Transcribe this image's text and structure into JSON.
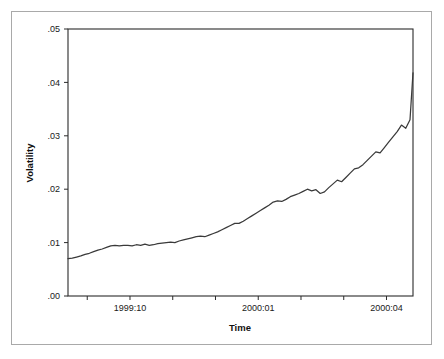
{
  "figure": {
    "background_color": "#ffffff",
    "frame_color": "#a9a9a9",
    "line_color": "#3a3a3a"
  },
  "chart_data": {
    "type": "line",
    "title": "",
    "xlabel": "Time",
    "ylabel": "Volatility",
    "grid": false,
    "legend": "none",
    "xtick_labels": [
      "1999:10",
      "2000:01",
      "2000:04"
    ],
    "xtick_positions": [
      1.0,
      4.0,
      7.0
    ],
    "minor_xticks": [
      0.0,
      2.0,
      3.0,
      5.0,
      6.0,
      8.0
    ],
    "ytick_labels": [
      ".00",
      ".01",
      ".02",
      ".03",
      ".04",
      ".05"
    ],
    "ytick_values": [
      0.0,
      0.01,
      0.02,
      0.03,
      0.04,
      0.05
    ],
    "ylim": [
      0.0,
      0.05
    ],
    "xlim": [
      -0.45,
      7.62
    ],
    "series": [
      {
        "name": "Volatility",
        "x": [
          -0.45,
          -0.35,
          -0.25,
          -0.15,
          -0.05,
          0.05,
          0.15,
          0.25,
          0.35,
          0.45,
          0.55,
          0.65,
          0.75,
          0.85,
          0.95,
          1.05,
          1.15,
          1.25,
          1.35,
          1.45,
          1.55,
          1.65,
          1.75,
          1.85,
          1.95,
          2.05,
          2.15,
          2.25,
          2.35,
          2.45,
          2.55,
          2.65,
          2.75,
          2.85,
          2.95,
          3.05,
          3.15,
          3.25,
          3.35,
          3.45,
          3.55,
          3.65,
          3.75,
          3.85,
          3.95,
          4.05,
          4.15,
          4.25,
          4.35,
          4.45,
          4.55,
          4.65,
          4.75,
          4.85,
          4.95,
          5.05,
          5.15,
          5.25,
          5.35,
          5.45,
          5.55,
          5.65,
          5.75,
          5.85,
          5.95,
          6.05,
          6.15,
          6.25,
          6.35,
          6.45,
          6.55,
          6.65,
          6.75,
          6.85,
          6.95,
          7.05,
          7.15,
          7.25,
          7.35,
          7.45,
          7.55,
          7.62
        ],
        "y": [
          0.007,
          0.0071,
          0.0073,
          0.0075,
          0.0078,
          0.008,
          0.0083,
          0.0086,
          0.0088,
          0.0091,
          0.0094,
          0.0095,
          0.0094,
          0.0095,
          0.0095,
          0.0094,
          0.0096,
          0.0095,
          0.0097,
          0.0095,
          0.0096,
          0.0098,
          0.0099,
          0.01,
          0.0101,
          0.01,
          0.0103,
          0.0105,
          0.0107,
          0.0109,
          0.0111,
          0.0112,
          0.0111,
          0.0114,
          0.0117,
          0.012,
          0.0124,
          0.0128,
          0.0132,
          0.0136,
          0.0136,
          0.014,
          0.0145,
          0.015,
          0.0155,
          0.016,
          0.0165,
          0.017,
          0.0176,
          0.0178,
          0.0177,
          0.0181,
          0.0186,
          0.0189,
          0.0192,
          0.0196,
          0.02,
          0.0197,
          0.0199,
          0.0192,
          0.0195,
          0.0203,
          0.021,
          0.0217,
          0.0214,
          0.0222,
          0.023,
          0.0238,
          0.024,
          0.0246,
          0.0254,
          0.0262,
          0.027,
          0.0268,
          0.0278,
          0.0288,
          0.0298,
          0.0308,
          0.032,
          0.0314,
          0.033,
          0.0418
        ],
        "start_value": 0.007,
        "end_value": 0.0418,
        "shape": "monotonic increasing, convex (accelerating)"
      }
    ]
  },
  "axis": {
    "x_title": "Time",
    "y_title": "Volatility"
  }
}
